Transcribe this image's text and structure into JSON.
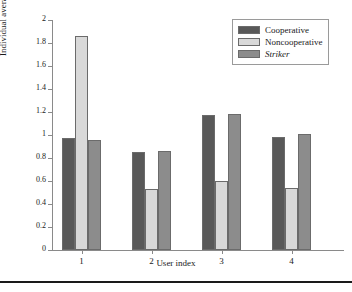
{
  "chart_data": {
    "type": "bar",
    "title": "",
    "xlabel": "User index",
    "ylabel": "Individual average data rate",
    "categories": [
      "1",
      "2",
      "3",
      "4"
    ],
    "ylim": [
      0,
      2
    ],
    "yticks": [
      "0",
      "0.2",
      "0.4",
      "0.6",
      "0.8",
      "1",
      "1.2",
      "1.4",
      "1.6",
      "1.8",
      "2"
    ],
    "ytick_values": [
      0,
      0.2,
      0.4,
      0.6,
      0.8,
      1,
      1.2,
      1.4,
      1.6,
      1.8,
      2
    ],
    "grid": false,
    "legend_position": "top-right",
    "series": [
      {
        "name": "Cooperative",
        "color": "#595959",
        "italic": false,
        "values": [
          0.97,
          0.855,
          1.175,
          0.98
        ]
      },
      {
        "name": "Noncooperative",
        "color": "#d9d9d9",
        "italic": false,
        "values": [
          1.86,
          0.53,
          0.6,
          0.535
        ]
      },
      {
        "name": "Striker",
        "color": "#8c8c8c",
        "italic": true,
        "values": [
          0.96,
          0.865,
          1.18,
          1.01
        ]
      }
    ]
  }
}
